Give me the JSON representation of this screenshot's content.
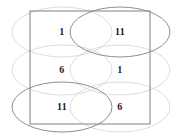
{
  "figure": {
    "title": "",
    "canvas": {
      "width": 173,
      "height": 140,
      "background": "#ffffff"
    },
    "colors": {
      "rectangle_stroke": "#8a8a8a",
      "ellipse_faint": "#d8d8d8",
      "ellipse_strong": "#8a8a8a",
      "label_color": "#1a1a1a"
    },
    "rectangle": {
      "x": 30,
      "y": 11,
      "width": 120,
      "height": 113
    },
    "grid": {
      "rows": 3,
      "columns": 2
    },
    "cells": [
      {
        "id": "cell-r1c1",
        "row": 1,
        "column": 1,
        "label": "1",
        "cx": 62,
        "cy": 32
      },
      {
        "id": "cell-r1c2",
        "row": 1,
        "column": 2,
        "label": "11",
        "cx": 120,
        "cy": 32
      },
      {
        "id": "cell-r2c1",
        "row": 2,
        "column": 1,
        "label": "6",
        "cx": 62,
        "cy": 70
      },
      {
        "id": "cell-r2c2",
        "row": 2,
        "column": 2,
        "label": "1",
        "cx": 120,
        "cy": 70
      },
      {
        "id": "cell-r3c1",
        "row": 3,
        "column": 1,
        "label": "11",
        "cx": 62,
        "cy": 107
      },
      {
        "id": "cell-r3c2",
        "row": 3,
        "column": 2,
        "label": "6",
        "cx": 120,
        "cy": 107
      }
    ],
    "ellipses": [
      {
        "id": "ellipse-r1c1",
        "cx": 62,
        "cy": 32,
        "rx": 50,
        "ry": 25,
        "emphasis": "faint"
      },
      {
        "id": "ellipse-r1c2",
        "cx": 120,
        "cy": 32,
        "rx": 50,
        "ry": 25,
        "emphasis": "strong"
      },
      {
        "id": "ellipse-r2c1",
        "cx": 62,
        "cy": 70,
        "rx": 50,
        "ry": 25,
        "emphasis": "faint"
      },
      {
        "id": "ellipse-r2c2",
        "cx": 120,
        "cy": 70,
        "rx": 50,
        "ry": 25,
        "emphasis": "faint"
      },
      {
        "id": "ellipse-r3c1",
        "cx": 62,
        "cy": 107,
        "rx": 50,
        "ry": 25,
        "emphasis": "strong"
      },
      {
        "id": "ellipse-r3c2",
        "cx": 120,
        "cy": 107,
        "rx": 50,
        "ry": 25,
        "emphasis": "faint"
      }
    ]
  }
}
